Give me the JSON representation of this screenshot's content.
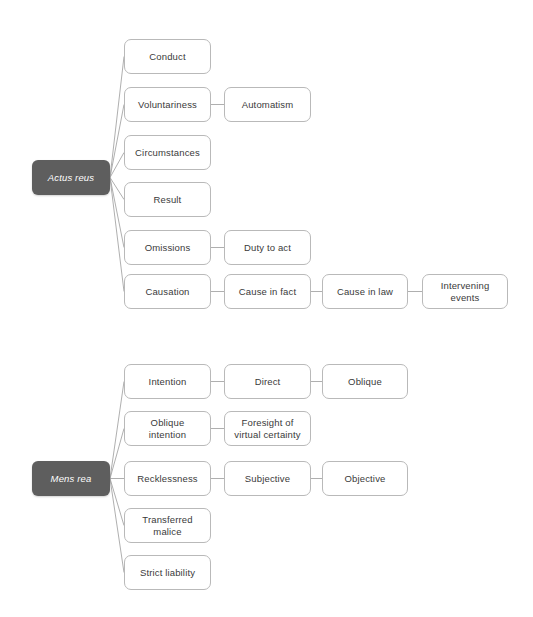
{
  "diagram": {
    "colors": {
      "root_fill": "#5e5e5e",
      "root_text": "#ffffff",
      "node_fill": "#ffffff",
      "node_border": "#b9b9b9",
      "node_text": "#3a3a3a",
      "link": "#a6a6a6",
      "background": "#ffffff"
    },
    "groups": [
      {
        "key": "actus_reus",
        "root": {
          "label": "Actus reus",
          "x": 32,
          "y": 160,
          "w": 78,
          "h": 35
        },
        "nodes": [
          {
            "key": "conduct",
            "label": "Conduct",
            "x": 124,
            "y": 39,
            "w": 87,
            "h": 35
          },
          {
            "key": "voluntariness",
            "label": "Voluntariness",
            "x": 124,
            "y": 87,
            "w": 87,
            "h": 35
          },
          {
            "key": "automatism",
            "label": "Automatism",
            "x": 224,
            "y": 87,
            "w": 87,
            "h": 35
          },
          {
            "key": "circumstances",
            "label": "Circumstances",
            "x": 124,
            "y": 135,
            "w": 87,
            "h": 35
          },
          {
            "key": "result",
            "label": "Result",
            "x": 124,
            "y": 182,
            "w": 87,
            "h": 35
          },
          {
            "key": "omissions",
            "label": "Omissions",
            "x": 124,
            "y": 230,
            "w": 87,
            "h": 35
          },
          {
            "key": "duty_to_act",
            "label": "Duty to act",
            "x": 224,
            "y": 230,
            "w": 87,
            "h": 35
          },
          {
            "key": "causation",
            "label": "Causation",
            "x": 124,
            "y": 274,
            "w": 87,
            "h": 35
          },
          {
            "key": "cause_in_fact",
            "label": "Cause in fact",
            "x": 224,
            "y": 274,
            "w": 87,
            "h": 35
          },
          {
            "key": "cause_in_law",
            "label": "Cause in law",
            "x": 322,
            "y": 274,
            "w": 86,
            "h": 35
          },
          {
            "key": "intervening_events",
            "label": "Intervening\nevents",
            "x": 422,
            "y": 274,
            "w": 86,
            "h": 35
          }
        ],
        "edges": [
          {
            "from": "root",
            "to": "conduct"
          },
          {
            "from": "root",
            "to": "voluntariness"
          },
          {
            "from": "root",
            "to": "circumstances"
          },
          {
            "from": "root",
            "to": "result"
          },
          {
            "from": "root",
            "to": "omissions"
          },
          {
            "from": "root",
            "to": "causation"
          },
          {
            "from": "voluntariness",
            "to": "automatism"
          },
          {
            "from": "omissions",
            "to": "duty_to_act"
          },
          {
            "from": "causation",
            "to": "cause_in_fact"
          },
          {
            "from": "cause_in_fact",
            "to": "cause_in_law"
          },
          {
            "from": "cause_in_law",
            "to": "intervening_events"
          }
        ]
      },
      {
        "key": "mens_rea",
        "root": {
          "label": "Mens rea",
          "x": 32,
          "y": 461,
          "w": 78,
          "h": 35
        },
        "nodes": [
          {
            "key": "intention",
            "label": "Intention",
            "x": 124,
            "y": 364,
            "w": 87,
            "h": 35
          },
          {
            "key": "direct",
            "label": "Direct",
            "x": 224,
            "y": 364,
            "w": 87,
            "h": 35
          },
          {
            "key": "oblique",
            "label": "Oblique",
            "x": 322,
            "y": 364,
            "w": 86,
            "h": 35
          },
          {
            "key": "oblique_intention",
            "label": "Oblique\nintention",
            "x": 124,
            "y": 411,
            "w": 87,
            "h": 35
          },
          {
            "key": "foresight",
            "label": "Foresight of\nvirtual certainty",
            "x": 224,
            "y": 411,
            "w": 87,
            "h": 35
          },
          {
            "key": "recklessness",
            "label": "Recklessness",
            "x": 124,
            "y": 461,
            "w": 87,
            "h": 35
          },
          {
            "key": "subjective",
            "label": "Subjective",
            "x": 224,
            "y": 461,
            "w": 87,
            "h": 35
          },
          {
            "key": "objective",
            "label": "Objective",
            "x": 322,
            "y": 461,
            "w": 86,
            "h": 35
          },
          {
            "key": "transferred_malice",
            "label": "Transferred\nmalice",
            "x": 124,
            "y": 508,
            "w": 87,
            "h": 35
          },
          {
            "key": "strict_liability",
            "label": "Strict liability",
            "x": 124,
            "y": 555,
            "w": 87,
            "h": 35
          }
        ],
        "edges": [
          {
            "from": "root",
            "to": "intention"
          },
          {
            "from": "root",
            "to": "oblique_intention"
          },
          {
            "from": "root",
            "to": "recklessness"
          },
          {
            "from": "root",
            "to": "transferred_malice"
          },
          {
            "from": "root",
            "to": "strict_liability"
          },
          {
            "from": "intention",
            "to": "direct"
          },
          {
            "from": "direct",
            "to": "oblique"
          },
          {
            "from": "oblique_intention",
            "to": "foresight"
          },
          {
            "from": "recklessness",
            "to": "subjective"
          },
          {
            "from": "subjective",
            "to": "objective"
          }
        ]
      }
    ]
  }
}
